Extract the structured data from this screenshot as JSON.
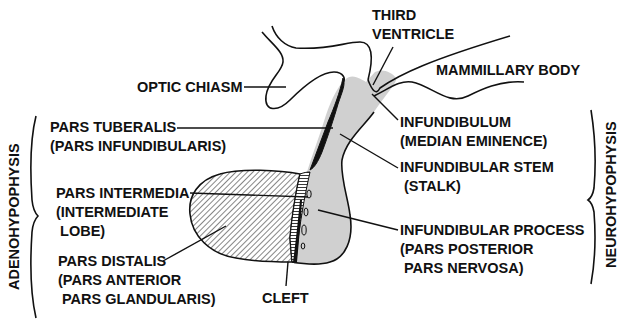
{
  "diagram": {
    "colors": {
      "ink": "#111111",
      "neuro_fill": "#d0d0d0",
      "background": "#ffffff"
    },
    "groups": {
      "left": "ADENOHYPOPHYSIS",
      "right": "NEUROHYPOPHYSIS"
    },
    "labels": {
      "third_ventricle": [
        "THIRD",
        "VENTRICLE"
      ],
      "optic_chiasm": [
        "OPTIC CHIASM"
      ],
      "mammillary_body": [
        "MAMMILLARY BODY"
      ],
      "pars_tuberalis": [
        "PARS TUBERALIS",
        "(PARS INFUNDIBULARIS)"
      ],
      "infundibulum": [
        "INFUNDIBULUM",
        "(MEDIAN EMINENCE)"
      ],
      "infundibular_stem": [
        "INFUNDIBULAR STEM",
        " (STALK)"
      ],
      "pars_intermedia": [
        "PARS INTERMEDIA",
        "(INTERMEDIATE",
        " LOBE)"
      ],
      "infundibular_process": [
        "INFUNDIBULAR PROCESS",
        "(PARS POSTERIOR",
        " PARS NERVOSA)"
      ],
      "pars_distalis": [
        "PARS DISTALIS",
        "(PARS ANTERIOR",
        " PARS GLANDULARIS)"
      ],
      "cleft": [
        "CLEFT"
      ]
    }
  }
}
